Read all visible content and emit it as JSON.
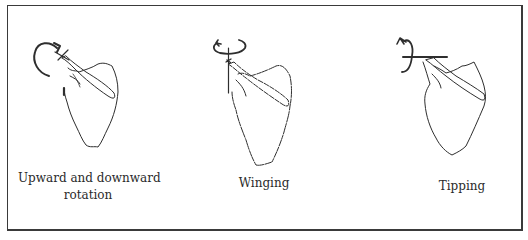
{
  "figure": {
    "panels": [
      {
        "label_line1": "Upward and downward",
        "label_line2": "rotation",
        "motion": "upward-downward-rotation",
        "axis": "anteroposterior"
      },
      {
        "label_line1": "Winging",
        "motion": "winging",
        "axis": "vertical"
      },
      {
        "label_line1": "Tipping",
        "motion": "tipping",
        "axis": "horizontal"
      }
    ]
  },
  "colors": {
    "stroke": "#2e2e2e",
    "border": "#3a3a3a",
    "background": "#ffffff"
  }
}
